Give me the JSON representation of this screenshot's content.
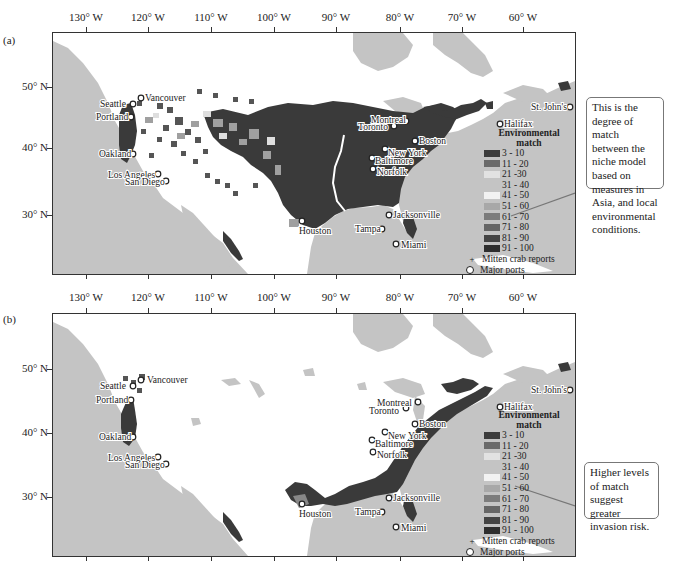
{
  "figure": {
    "longitude_labels": [
      "130° W",
      "120° W",
      "110° W",
      "100° W",
      "90° W",
      "80° W",
      "70° W",
      "60° W"
    ],
    "latitude_labels": [
      "50° N",
      "40° N",
      "30° N"
    ],
    "colors": {
      "ocean": "#c4c4c4",
      "land_no_match": "#ffffff",
      "high_match": "#3a3a3a",
      "callout_border": "#777777"
    }
  },
  "panels": [
    {
      "label": "(a)",
      "callout": "This is the degree of match between the niche model based on measures in Asia, and local environmental conditions.",
      "legend": {
        "title_line1": "Environmental",
        "title_line2": "match",
        "classes": [
          {
            "label": "3 - 10",
            "color": "#3c3c3c"
          },
          {
            "label": "11 - 20",
            "color": "#6a6a6a"
          },
          {
            "label": "21 -30",
            "color": "#e2e2e2"
          },
          {
            "label": "31 - 40",
            "color": "#c4c4c4"
          },
          {
            "label": "41 - 50",
            "color": "#f2f2f2"
          },
          {
            "label": "51 - 60",
            "color": "#a8a8a8"
          },
          {
            "label": "61 - 70",
            "color": "#7c7c7c"
          },
          {
            "label": "71 - 80",
            "color": "#666666"
          },
          {
            "label": "81 - 90",
            "color": "#444444"
          },
          {
            "label": "91 - 100",
            "color": "#2e2e2e"
          }
        ],
        "mitten_crab": "Mitten crab reports",
        "major_ports": "Major ports"
      }
    },
    {
      "label": "(b)",
      "callout": "Higher levels of match suggest greater invasion risk.",
      "legend": {
        "title_line1": "Environmental",
        "title_line2": "match",
        "classes": [
          {
            "label": "3 - 10",
            "color": "#3c3c3c"
          },
          {
            "label": "11 - 20",
            "color": "#6a6a6a"
          },
          {
            "label": "21 -30",
            "color": "#e2e2e2"
          },
          {
            "label": "31 - 40",
            "color": "#c4c4c4"
          },
          {
            "label": "41 - 50",
            "color": "#f2f2f2"
          },
          {
            "label": "51 - 60",
            "color": "#a8a8a8"
          },
          {
            "label": "61 - 70",
            "color": "#7c7c7c"
          },
          {
            "label": "71 - 80",
            "color": "#666666"
          },
          {
            "label": "81 - 90",
            "color": "#444444"
          },
          {
            "label": "91 - 100",
            "color": "#2e2e2e"
          }
        ],
        "mitten_crab": "Mitten crab reports",
        "major_ports": "Major ports"
      }
    }
  ],
  "ports": [
    "Vancouver",
    "Seattle",
    "Portland",
    "Oakland",
    "Los Angeles",
    "San Diego",
    "Houston",
    "Tampa",
    "Miami",
    "Jacksonville",
    "Norfolk",
    "Baltimore",
    "New York",
    "Boston",
    "Toronto",
    "Montreal",
    "Halifax",
    "St. John's"
  ]
}
